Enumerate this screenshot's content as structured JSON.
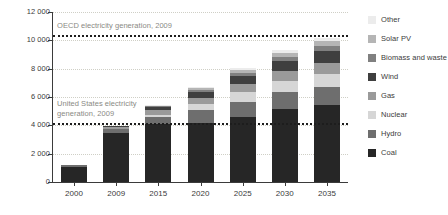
{
  "chart_data": {
    "type": "bar",
    "stacked": true,
    "title": "",
    "xlabel": "",
    "ylabel": "TWh",
    "ylim": [
      0,
      12000
    ],
    "ytick_values": [
      0,
      2000,
      4000,
      6000,
      8000,
      10000,
      12000
    ],
    "ytick_labels": [
      "0",
      "2 000",
      "4 000",
      "6 000",
      "8 000",
      "10 000",
      "12 000"
    ],
    "grid": true,
    "legend_position": "right",
    "categories": [
      "2000",
      "2009",
      "2015",
      "2020",
      "2025",
      "2030",
      "2035"
    ],
    "series": [
      {
        "name": "Coal",
        "color": "#262626",
        "values": [
          1080,
          3480,
          4060,
          4170,
          4580,
          5150,
          5440
        ]
      },
      {
        "name": "Hydro",
        "color": "#6e6e6e",
        "values": [
          90,
          230,
          560,
          890,
          1090,
          1180,
          1280
        ]
      },
      {
        "name": "Nuclear",
        "color": "#d6d6d6",
        "values": [
          15,
          60,
          120,
          420,
          660,
          800,
          900
        ]
      },
      {
        "name": "Gas",
        "color": "#9a9a9a",
        "values": [
          40,
          120,
          320,
          480,
          610,
          720,
          800
        ]
      },
      {
        "name": "Wind",
        "color": "#3f3f3f",
        "values": [
          5,
          50,
          210,
          420,
          560,
          700,
          830
        ]
      },
      {
        "name": "Biomass and waste",
        "color": "#808080",
        "values": [
          5,
          25,
          70,
          140,
          220,
          300,
          380
        ]
      },
      {
        "name": "Solar PV",
        "color": "#b5b5b5",
        "values": [
          2,
          10,
          45,
          120,
          200,
          280,
          340
        ]
      },
      {
        "name": "Other",
        "color": "#ececec",
        "values": [
          3,
          15,
          35,
          70,
          120,
          170,
          210
        ]
      }
    ],
    "reference_lines": [
      {
        "name": "oecd",
        "label": "OECD electricity generation, 2009",
        "value": 10400,
        "color": "#1d1d1d"
      },
      {
        "name": "united-states",
        "label": "United States electricity\ngeneration, 2009",
        "value": 4150,
        "color": "#1d1d1d"
      }
    ]
  },
  "legend": {
    "items": [
      {
        "label": "Other",
        "color": "#ececec"
      },
      {
        "label": "Solar PV",
        "color": "#b5b5b5"
      },
      {
        "label": "Biomass and waste",
        "color": "#808080"
      },
      {
        "label": "Wind",
        "color": "#3f3f3f"
      },
      {
        "label": "Gas",
        "color": "#9a9a9a"
      },
      {
        "label": "Nuclear",
        "color": "#d6d6d6"
      },
      {
        "label": "Hydro",
        "color": "#6e6e6e"
      },
      {
        "label": "Coal",
        "color": "#262626"
      }
    ]
  }
}
